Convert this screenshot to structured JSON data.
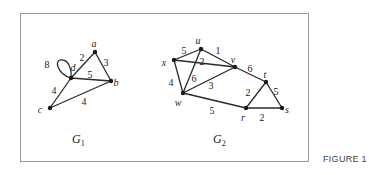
{
  "figure": {
    "caption": "FIGURE 1",
    "frame": {
      "x": 20,
      "y": 13,
      "w": 288,
      "h": 148,
      "stroke": "#9a9a9a"
    }
  },
  "graphs": [
    {
      "name": "G",
      "subscript": "1",
      "label_pos": {
        "x": 72,
        "y": 143
      },
      "vertices": [
        {
          "id": "a",
          "x": 95,
          "y": 52,
          "lx": 94,
          "ly": 45
        },
        {
          "id": "b",
          "x": 111,
          "y": 81,
          "lx": 116,
          "ly": 84
        },
        {
          "id": "c",
          "x": 50,
          "y": 108,
          "lx": 40,
          "ly": 111
        },
        {
          "id": "d",
          "x": 71,
          "y": 78,
          "lx": 73,
          "ly": 69
        }
      ],
      "edges": [
        {
          "from": "a",
          "to": "d",
          "weight": "2",
          "lx": 82,
          "ly": 59
        },
        {
          "from": "a",
          "to": "b",
          "weight": "3",
          "lx": 106,
          "ly": 64
        },
        {
          "from": "d",
          "to": "b",
          "weight": "5",
          "lx": 90,
          "ly": 76
        },
        {
          "from": "d",
          "to": "c",
          "weight": "4",
          "lx": 54,
          "ly": 92
        },
        {
          "from": "c",
          "to": "b",
          "weight": "4",
          "lx": 84,
          "ly": 103
        },
        {
          "from": "d",
          "to": "d",
          "weight": "8",
          "lx": 47,
          "ly": 66,
          "loop": true
        }
      ]
    },
    {
      "name": "G",
      "subscript": "2",
      "label_pos": {
        "x": 213,
        "y": 143
      },
      "vertices": [
        {
          "id": "u",
          "x": 201,
          "y": 49,
          "lx": 198,
          "ly": 42
        },
        {
          "id": "v",
          "x": 235,
          "y": 67,
          "lx": 233,
          "ly": 61
        },
        {
          "id": "x",
          "x": 174,
          "y": 60,
          "lx": 164,
          "ly": 64
        },
        {
          "id": "w",
          "x": 183,
          "y": 93,
          "lx": 178,
          "ly": 104
        },
        {
          "id": "t",
          "x": 266,
          "y": 82,
          "lx": 265,
          "ly": 76
        },
        {
          "id": "r",
          "x": 246,
          "y": 108,
          "lx": 243,
          "ly": 119
        },
        {
          "id": "s",
          "x": 282,
          "y": 108,
          "lx": 287,
          "ly": 111
        }
      ],
      "edges": [
        {
          "from": "x",
          "to": "u",
          "weight": "5",
          "lx": 184,
          "ly": 52
        },
        {
          "from": "u",
          "to": "v",
          "weight": "1",
          "lx": 218,
          "ly": 52
        },
        {
          "from": "x",
          "to": "v",
          "weight": "2",
          "lx": 202,
          "ly": 63
        },
        {
          "from": "u",
          "to": "w",
          "weight": "6",
          "lx": 194,
          "ly": 80
        },
        {
          "from": "x",
          "to": "w",
          "weight": "4",
          "lx": 171,
          "ly": 84
        },
        {
          "from": "w",
          "to": "v",
          "weight": "3",
          "lx": 211,
          "ly": 87
        },
        {
          "from": "v",
          "to": "t",
          "weight": "6",
          "lx": 250,
          "ly": 70
        },
        {
          "from": "w",
          "to": "r",
          "weight": "5",
          "lx": 212,
          "ly": 112
        },
        {
          "from": "r",
          "to": "t",
          "weight": "2",
          "lx": 248,
          "ly": 94
        },
        {
          "from": "t",
          "to": "s",
          "weight": "5",
          "lx": 276,
          "ly": 93
        },
        {
          "from": "r",
          "to": "s",
          "weight": "2",
          "lx": 262,
          "ly": 119
        }
      ]
    }
  ]
}
